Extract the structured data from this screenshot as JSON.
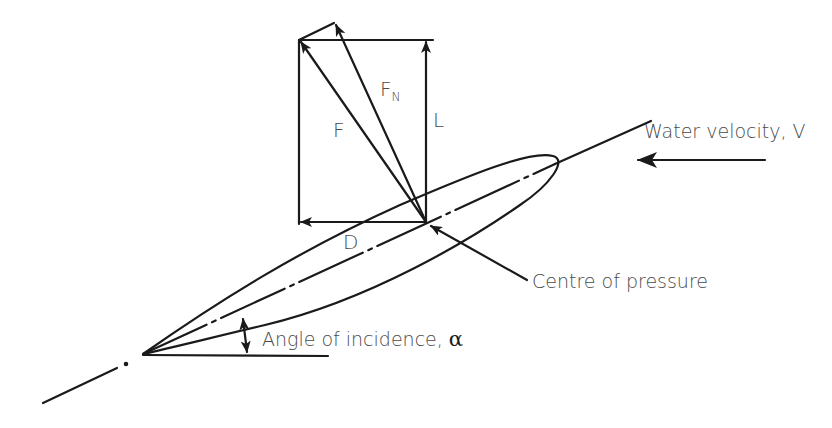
{
  "diagram": {
    "type": "hydrofoil force diagram",
    "colors": {
      "line": "#1a1a1a",
      "text": "#4a4a4a",
      "background": "#ffffff"
    },
    "labels": {
      "resultant_force": "F",
      "normal_force_main": "F",
      "normal_force_sub": "N",
      "lift": "L",
      "drag": "D",
      "water_velocity": "Water velocity, V",
      "centre_of_pressure": "Centre of pressure",
      "angle_of_incidence": "Angle of incidence, ",
      "alpha_symbol": "α"
    }
  }
}
